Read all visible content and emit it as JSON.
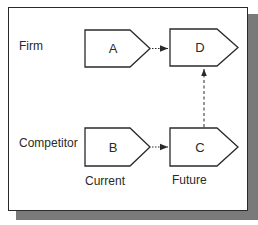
{
  "diagram": {
    "rows": [
      {
        "label": "Firm"
      },
      {
        "label": "Competitor"
      }
    ],
    "columns": [
      {
        "label": "Current"
      },
      {
        "label": "Future"
      }
    ],
    "nodes": {
      "A": {
        "label": "A",
        "row": "Firm",
        "column": "Current"
      },
      "D": {
        "label": "D",
        "row": "Firm",
        "column": "Future"
      },
      "B": {
        "label": "B",
        "row": "Competitor",
        "column": "Current"
      },
      "C": {
        "label": "C",
        "row": "Competitor",
        "column": "Future"
      }
    },
    "edges": [
      {
        "from": "A",
        "to": "D",
        "style": "solid"
      },
      {
        "from": "B",
        "to": "C",
        "style": "solid"
      },
      {
        "from": "C",
        "to": "D",
        "style": "dashed"
      }
    ],
    "colors": {
      "stroke": "#2a2a2a",
      "shadow": "#7a7a7a",
      "background": "#ffffff"
    }
  }
}
